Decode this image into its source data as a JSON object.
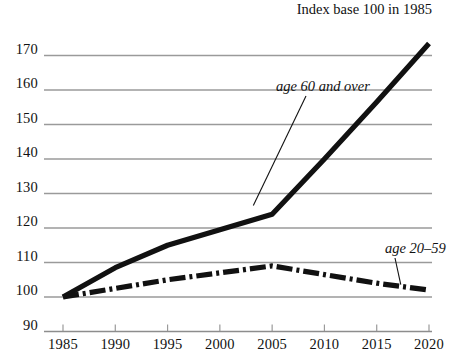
{
  "caption": "Index base 100 in 1985",
  "chart_data": {
    "type": "line",
    "title": "",
    "subtitle": "Index base 100 in 1985",
    "xlabel": "",
    "ylabel": "",
    "xlim": [
      1985,
      2020
    ],
    "ylim": [
      90,
      170
    ],
    "grid": true,
    "gridlines_y": [
      100,
      110,
      120,
      130,
      140,
      150,
      160,
      170
    ],
    "legend_position": "inline-annotations",
    "x": [
      1985,
      1990,
      1995,
      2000,
      2005,
      2010,
      2015,
      2020
    ],
    "xticks": [
      "1985",
      "1990",
      "1995",
      "2000",
      "2005",
      "2010",
      "2015",
      "2020"
    ],
    "yticks": [
      "90",
      "100",
      "110",
      "120",
      "130",
      "140",
      "150",
      "160",
      "170"
    ],
    "series": [
      {
        "name": "age 60 and over",
        "style": "solid-thick",
        "color": "#111111",
        "values": [
          100.0,
          108.5,
          115.0,
          119.5,
          124.0,
          140.0,
          156.5,
          173.5
        ]
      },
      {
        "name": "age 20-59",
        "style": "dash-dot-thick",
        "color": "#111111",
        "values": [
          100.0,
          102.5,
          105.0,
          107.0,
          109.0,
          106.5,
          104.0,
          102.0
        ]
      }
    ],
    "annotations": [
      {
        "text": "age 60 and over",
        "target_year": 2003,
        "target_value": 129
      },
      {
        "text": "age 20–59",
        "target_year": 2017.5,
        "target_value": 103.5
      }
    ]
  },
  "axis": {
    "y_labels": [
      "170",
      "160",
      "150",
      "140",
      "130",
      "120",
      "110",
      "100",
      "90"
    ],
    "x_labels": [
      "1985",
      "1990",
      "1995",
      "2000",
      "2005",
      "2010",
      "2015",
      "2020"
    ]
  },
  "labels": {
    "series_old": "age 60 and over",
    "series_young": "age 20–59"
  },
  "colors": {
    "ink": "#111111",
    "grid": "#9a9a9a",
    "background": "#ffffff"
  }
}
